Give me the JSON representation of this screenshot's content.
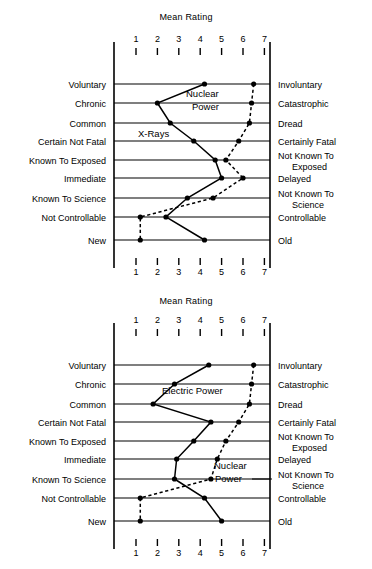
{
  "charts": [
    {
      "id": "top",
      "title": "Mean Rating",
      "row_labels_left": [
        "Voluntary",
        "Chronic",
        "Common",
        "Certain Not Fatal",
        "Known To Exposed",
        "Immediate",
        "Known To Science",
        "Not Controllable",
        "New"
      ],
      "row_labels_right": [
        "Involuntary",
        "Catastrophic",
        "Dread",
        "Certainly Fatal",
        "Not Known To Exposed",
        "Delayed",
        "Not Known To Science",
        "Controllable",
        "Old"
      ],
      "tick_labels": [
        "1",
        "2",
        "3",
        "4",
        "5",
        "6",
        "7"
      ],
      "series_labels": [
        "X-Rays",
        "Nuclear Power"
      ]
    },
    {
      "id": "bottom",
      "title": "Mean Rating",
      "row_labels_left": [
        "Voluntary",
        "Chronic",
        "Common",
        "Certain Not Fatal",
        "Known To Exposed",
        "Immediate",
        "Known To Science",
        "Not Controllable",
        "New"
      ],
      "row_labels_right": [
        "Involuntary",
        "Catastrophic",
        "Dread",
        "Certainly Fatal",
        "Not Known To Exposed",
        "Delayed",
        "Not Known To Science",
        "Controllable",
        "Old"
      ],
      "tick_labels": [
        "1",
        "2",
        "3",
        "4",
        "5",
        "6",
        "7"
      ],
      "series_labels": [
        "Electric Power",
        "Nuclear Power"
      ]
    }
  ],
  "chart_data": [
    {
      "type": "line",
      "title": "Mean Rating",
      "xlabel": "Mean Rating",
      "ylabel": "",
      "xlim": [
        1,
        7
      ],
      "xticks": [
        1,
        2,
        3,
        4,
        5,
        6,
        7
      ],
      "grid": true,
      "orientation": "horizontal-categories",
      "categories": [
        "Voluntary",
        "Chronic",
        "Common",
        "Certain Not Fatal",
        "Known To Exposed",
        "Immediate",
        "Known To Science",
        "Not Controllable",
        "New"
      ],
      "categories_right": [
        "Involuntary",
        "Catastrophic",
        "Dread",
        "Certainly Fatal",
        "Not Known To Exposed",
        "Delayed",
        "Not Known To Science",
        "Controllable",
        "Old"
      ],
      "series": [
        {
          "name": "X-Rays",
          "style": "solid",
          "values": [
            4.2,
            2.0,
            2.6,
            3.7,
            4.7,
            5.0,
            3.4,
            2.4,
            4.2
          ]
        },
        {
          "name": "Nuclear Power",
          "style": "dashed",
          "values": [
            6.5,
            6.4,
            6.3,
            5.8,
            5.2,
            6.0,
            4.6,
            1.2,
            1.2
          ]
        }
      ],
      "annotations": [
        "Nuclear Power",
        "X-Rays"
      ]
    },
    {
      "type": "line",
      "title": "Mean Rating",
      "xlabel": "Mean Rating",
      "ylabel": "",
      "xlim": [
        1,
        7
      ],
      "xticks": [
        1,
        2,
        3,
        4,
        5,
        6,
        7
      ],
      "grid": true,
      "orientation": "horizontal-categories",
      "categories": [
        "Voluntary",
        "Chronic",
        "Common",
        "Certain Not Fatal",
        "Known To Exposed",
        "Immediate",
        "Known To Science",
        "Not Controllable",
        "New"
      ],
      "categories_right": [
        "Involuntary",
        "Catastrophic",
        "Dread",
        "Certainly Fatal",
        "Not Known To Exposed",
        "Delayed",
        "Not Known To Science",
        "Controllable",
        "Old"
      ],
      "series": [
        {
          "name": "Electric Power",
          "style": "solid",
          "values": [
            4.4,
            2.8,
            1.8,
            4.5,
            3.7,
            2.9,
            2.8,
            4.2,
            5.0
          ]
        },
        {
          "name": "Nuclear Power",
          "style": "dashed",
          "values": [
            6.5,
            6.4,
            6.3,
            5.8,
            5.2,
            4.8,
            4.5,
            1.2,
            1.2
          ]
        }
      ],
      "annotations": [
        "Electric Power",
        "Nuclear Power"
      ]
    }
  ]
}
